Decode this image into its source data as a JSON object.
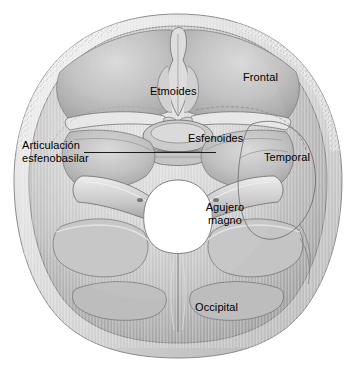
{
  "figure": {
    "background_color": "#ffffff",
    "ink_color": "#000000",
    "bone_tone_light": "#e8e8e8",
    "bone_tone_mid": "#b9b9b9",
    "bone_tone_dark": "#8d8d8d",
    "outline_color": "#6f6f6f"
  },
  "labels": {
    "articulacion_line1": "Articulación",
    "articulacion_line2": "esfenobasilar",
    "etmoides": "Etmoides",
    "frontal": "Frontal",
    "esfenoides": "Esfenoides",
    "temporal": "Temporal",
    "agujero_line1": "Agujero",
    "agujero_line2": "magno",
    "occipital": "Occipital"
  },
  "leader_lines": [
    {
      "name": "articulacion-esfenobasilar-leader",
      "from_label": "Articulación esfenobasilar",
      "x1": 84,
      "y1": 152,
      "x2": 216,
      "y2": 152
    }
  ],
  "regions": [
    {
      "name": "frontal-bone",
      "label": "Frontal"
    },
    {
      "name": "ethmoid-bone",
      "label": "Etmoides"
    },
    {
      "name": "sphenoid-bone",
      "label": "Esfenoides"
    },
    {
      "name": "temporal-bone",
      "label": "Temporal"
    },
    {
      "name": "occipital-bone",
      "label": "Occipital"
    },
    {
      "name": "foramen-magnum",
      "label": "Agujero magno"
    }
  ]
}
